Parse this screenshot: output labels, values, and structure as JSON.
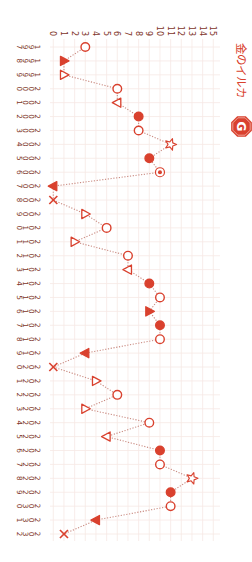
{
  "chart_data": {
    "type": "line",
    "title": "金のイルカ",
    "badge": "G",
    "orientation": "rotated 90deg clockwise",
    "xlabel": "",
    "ylabel": "",
    "grid": true,
    "legend": null,
    "ylim": [
      0,
      15
    ],
    "yticks": [
      0,
      1,
      2,
      3,
      4,
      5,
      6,
      7,
      8,
      9,
      10,
      11,
      12,
      13,
      14,
      15
    ],
    "categories": [
      "1997",
      "1998",
      "1999",
      "2000",
      "2001",
      "2002",
      "2003",
      "2004",
      "2005",
      "2006",
      "2007",
      "2008",
      "2009",
      "2010",
      "2011",
      "2012",
      "2013",
      "2014",
      "2015",
      "2016",
      "2017",
      "2018",
      "2019",
      "2020",
      "2021",
      "2022",
      "2023",
      "2024",
      "2025",
      "2026",
      "2027",
      "2028",
      "2029",
      "2030",
      "2031",
      "2032"
    ],
    "values": [
      3,
      1,
      1,
      6,
      6,
      8,
      8,
      11,
      9,
      10,
      0,
      0,
      3,
      5,
      2,
      7,
      7,
      9,
      10,
      9,
      10,
      10,
      3,
      0,
      4,
      6,
      3,
      9,
      5,
      10,
      10,
      13,
      11,
      11,
      4,
      1
    ],
    "markers": [
      "open-circle",
      "filled-triangle-up",
      "open-triangle-up",
      "open-circle",
      "open-triangle-down",
      "filled-circle",
      "open-circle",
      "open-star",
      "filled-circle",
      "double-circle",
      "filled-triangle-down",
      "x",
      "open-triangle-up",
      "open-circle",
      "open-triangle-up",
      "open-circle",
      "open-triangle-down",
      "filled-circle",
      "open-circle",
      "filled-triangle-up",
      "filled-circle",
      "open-circle",
      "filled-triangle-down",
      "x",
      "open-triangle-up",
      "open-circle",
      "open-triangle-up",
      "open-circle",
      "open-triangle-down",
      "filled-circle",
      "open-circle",
      "open-star",
      "filled-circle",
      "open-circle",
      "filled-triangle-down",
      "x"
    ],
    "line_style": "dotted",
    "colors": {
      "accent": "#d9412e",
      "line": "#c98a80",
      "grid": "#f6e8e5",
      "label": "#7e3428",
      "background": "#ffffff"
    }
  }
}
